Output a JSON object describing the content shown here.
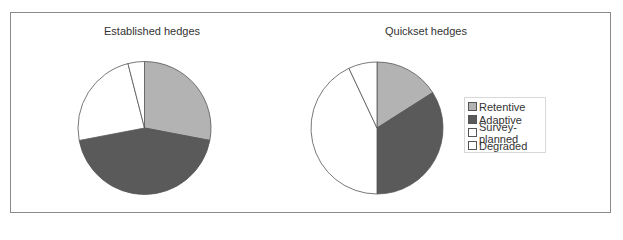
{
  "chart_data": [
    {
      "type": "pie",
      "title": "Established hedges",
      "categories": [
        "Retentive",
        "Adaptive",
        "Survey-planned",
        "Degraded"
      ],
      "values": [
        28,
        44,
        24,
        4
      ],
      "unit": "percent (estimated from slice angles)",
      "start_angle": "12 o'clock, clockwise",
      "colors": [
        "#b3b3b3",
        "#5a5a5a",
        "#ffffff",
        "#ffffff"
      ]
    },
    {
      "type": "pie",
      "title": "Quickset hedges",
      "categories": [
        "Retentive",
        "Adaptive",
        "Survey-planned",
        "Degraded"
      ],
      "values": [
        16,
        34,
        43,
        7
      ],
      "unit": "percent (estimated from slice angles)",
      "start_angle": "12 o'clock, clockwise",
      "colors": [
        "#b3b3b3",
        "#5a5a5a",
        "#ffffff",
        "#ffffff"
      ]
    }
  ],
  "titles": {
    "established": "Established hedges",
    "quickset": "Quickset hedges"
  },
  "legend": {
    "position": "right",
    "items": [
      {
        "label": "Retentive",
        "color": "#b3b3b3"
      },
      {
        "label": "Adaptive",
        "color": "#5a5a5a"
      },
      {
        "label": "Survey-planned",
        "color": "#ffffff"
      },
      {
        "label": "Degraded",
        "color": "#ffffff"
      }
    ]
  }
}
